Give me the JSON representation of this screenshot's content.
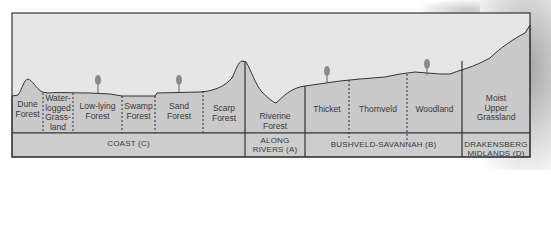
{
  "diagram": {
    "type": "landscape-cross-section",
    "colors": {
      "sky": "#e6e6e6",
      "ground": "#c9c9c9",
      "band": "#cfcfcf",
      "line": "#333333",
      "tree": "#8a8a8a"
    },
    "zones": [
      {
        "id": "dune-forest",
        "lines": [
          "Dune",
          "Forest"
        ]
      },
      {
        "id": "waterlogged-grassland",
        "lines": [
          "Water-",
          "logged",
          "Grass-",
          "land"
        ]
      },
      {
        "id": "low-lying-forest",
        "lines": [
          "Low-lying",
          "Forest"
        ]
      },
      {
        "id": "swamp-forest",
        "lines": [
          "Swamp",
          "Forest"
        ]
      },
      {
        "id": "sand-forest",
        "lines": [
          "Sand",
          "Forest"
        ]
      },
      {
        "id": "scarp-forest",
        "lines": [
          "Scarp",
          "Forest"
        ]
      },
      {
        "id": "riverine-forest",
        "lines": [
          "Riverine",
          "Forest"
        ]
      },
      {
        "id": "thicket",
        "lines": [
          "Thicket"
        ]
      },
      {
        "id": "thornveld",
        "lines": [
          "Thornveld"
        ]
      },
      {
        "id": "woodland",
        "lines": [
          "Woodland"
        ]
      },
      {
        "id": "moist-upper-grassland",
        "lines": [
          "Moist",
          "Upper",
          "Grassland"
        ]
      }
    ],
    "regions": [
      {
        "id": "coast",
        "lines": [
          "COAST (C)"
        ]
      },
      {
        "id": "along-rivers",
        "lines": [
          "ALONG",
          "RIVERS (A)"
        ]
      },
      {
        "id": "bushveld-savannah",
        "lines": [
          "BUSHVELD-SAVANNAH (B)"
        ]
      },
      {
        "id": "drakensberg-midlands",
        "lines": [
          "DRAKENSBERG",
          "MIDLANDS (D)"
        ]
      }
    ]
  }
}
